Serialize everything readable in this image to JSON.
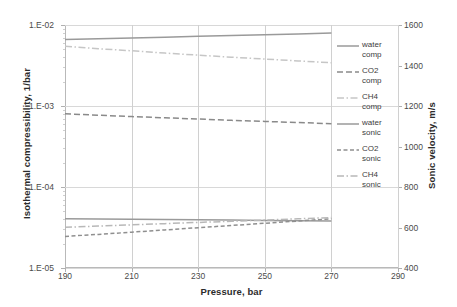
{
  "chart_data": {
    "type": "line",
    "title": "",
    "xlabel": "Pressure, bar",
    "ylabel": "Isothermal compressibility, 1/bar",
    "y2label": "Sonic velocity, m/s",
    "xlim": [
      190,
      290
    ],
    "xticks": [
      "190",
      "210",
      "230",
      "250",
      "270",
      "290"
    ],
    "xtick_values": [
      190,
      210,
      230,
      250,
      270,
      290
    ],
    "ylim": [
      1e-05,
      0.01
    ],
    "yscale": "log",
    "yticks": [
      "1.E-05",
      "1.E-04",
      "1.E-03",
      "1.E-02"
    ],
    "ytick_values": [
      1e-05,
      0.0001,
      0.001,
      0.01
    ],
    "y2lim": [
      400,
      1600
    ],
    "y2ticks": [
      "400",
      "600",
      "800",
      "1000",
      "1200",
      "1400",
      "1600"
    ],
    "y2tick_values": [
      400,
      600,
      800,
      1000,
      1200,
      1400,
      1600
    ],
    "grid": "horizontal and vertical",
    "legend_position": "right",
    "x": [
      190,
      200,
      210,
      220,
      230,
      240,
      250,
      260,
      270
    ],
    "series": [
      {
        "name": "water comp",
        "axis": "left",
        "style": "solid",
        "color": "#9a9a9a",
        "legend_label": "water\ncomp",
        "values": [
          4.05e-05,
          4.02e-05,
          3.99e-05,
          3.96e-05,
          3.93e-05,
          3.9e-05,
          3.87e-05,
          3.84e-05,
          3.81e-05
        ]
      },
      {
        "name": "CO2 comp",
        "axis": "left",
        "style": "dashed",
        "color": "#8a8a8a",
        "legend_label": "CO2\ncomp",
        "values": [
          0.0008,
          0.00077,
          0.00074,
          0.000715,
          0.00069,
          0.000665,
          0.000645,
          0.000625,
          0.000605
        ]
      },
      {
        "name": "CH4 comp",
        "axis": "left",
        "style": "dashdot",
        "color": "#c6c6c6",
        "legend_label": "CH4\ncomp",
        "values": [
          0.00545,
          0.0051,
          0.0048,
          0.0045,
          0.00425,
          0.004,
          0.0038,
          0.0036,
          0.00342
        ]
      },
      {
        "name": "water sonic",
        "axis": "right",
        "style": "solid",
        "color": "#9a9a9a",
        "legend_label": "water\nsonic",
        "values": [
          1528,
          1532,
          1536,
          1540,
          1544,
          1548,
          1552,
          1556,
          1560
        ]
      },
      {
        "name": "CO2 sonic",
        "axis": "right",
        "style": "dashed-short",
        "color": "#8f8f8f",
        "legend_label": "CO2\nsonic",
        "values": [
          556,
          566,
          577,
          588,
          599,
          610,
          621,
          632,
          643
        ]
      },
      {
        "name": "CH4 sonic",
        "axis": "right",
        "style": "dashdot",
        "color": "#b8b8b8",
        "legend_label": "CH4\nsonic",
        "values": [
          601,
          607,
          613,
          619,
          625,
          631,
          637,
          643,
          649
        ]
      }
    ]
  }
}
